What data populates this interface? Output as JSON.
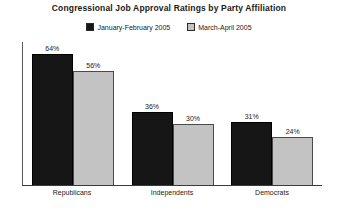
{
  "chart_data": {
    "type": "bar",
    "title": "Congressional Job Approval Ratings by Party Affiliation",
    "xlabel": "",
    "ylabel": "",
    "ylim": [
      0,
      70
    ],
    "grid": false,
    "legend_position": "top-center",
    "value_suffix": "%",
    "categories": [
      "Republicans",
      "Independents",
      "Democrats"
    ],
    "series": [
      {
        "name": "January-February 2005",
        "color": "#161616",
        "values": [
          64,
          36,
          31
        ],
        "labels": [
          "64%",
          "36%",
          "31%"
        ]
      },
      {
        "name": "March-April 2005",
        "color": "#c3c3c3",
        "values": [
          56,
          30,
          24
        ],
        "labels": [
          "56%",
          "30%",
          "24%"
        ]
      }
    ]
  }
}
